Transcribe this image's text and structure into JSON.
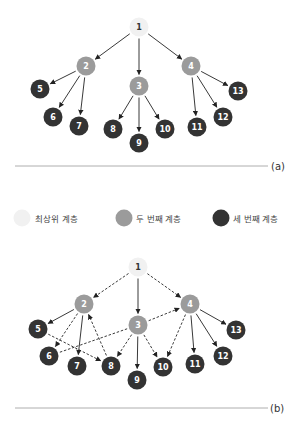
{
  "colors": {
    "top": "#f1f1f1",
    "second": "#9b9b9b",
    "third": "#333333",
    "edge": "#222222",
    "rule": "#999999"
  },
  "legend": [
    {
      "level": "top",
      "label": "최상위 계층"
    },
    {
      "level": "second",
      "label": "두 번째 계층"
    },
    {
      "level": "third",
      "label": "세 번째 계층"
    }
  ],
  "diagrams": [
    {
      "caption": "(a)",
      "nodes": [
        {
          "id": "1",
          "level": "top",
          "x": 139,
          "y": 27
        },
        {
          "id": "2",
          "level": "second",
          "x": 86,
          "y": 66
        },
        {
          "id": "3",
          "level": "second",
          "x": 139,
          "y": 86
        },
        {
          "id": "4",
          "level": "second",
          "x": 191,
          "y": 66
        },
        {
          "id": "5",
          "level": "third",
          "x": 40,
          "y": 89
        },
        {
          "id": "6",
          "level": "third",
          "x": 53,
          "y": 117
        },
        {
          "id": "7",
          "level": "third",
          "x": 79,
          "y": 126
        },
        {
          "id": "8",
          "level": "third",
          "x": 113,
          "y": 129
        },
        {
          "id": "9",
          "level": "third",
          "x": 139,
          "y": 143
        },
        {
          "id": "10",
          "level": "third",
          "x": 165,
          "y": 129
        },
        {
          "id": "11",
          "level": "third",
          "x": 197,
          "y": 127
        },
        {
          "id": "12",
          "level": "third",
          "x": 223,
          "y": 117
        },
        {
          "id": "13",
          "level": "third",
          "x": 238,
          "y": 91
        }
      ],
      "edges": [
        {
          "from": "1",
          "to": "2",
          "style": "solid"
        },
        {
          "from": "1",
          "to": "3",
          "style": "solid"
        },
        {
          "from": "1",
          "to": "4",
          "style": "solid"
        },
        {
          "from": "2",
          "to": "5",
          "style": "solid"
        },
        {
          "from": "2",
          "to": "6",
          "style": "solid"
        },
        {
          "from": "2",
          "to": "7",
          "style": "solid"
        },
        {
          "from": "3",
          "to": "8",
          "style": "solid"
        },
        {
          "from": "3",
          "to": "9",
          "style": "solid"
        },
        {
          "from": "3",
          "to": "10",
          "style": "solid"
        },
        {
          "from": "4",
          "to": "11",
          "style": "solid"
        },
        {
          "from": "4",
          "to": "12",
          "style": "solid"
        },
        {
          "from": "4",
          "to": "13",
          "style": "solid"
        }
      ],
      "rule": {
        "x1": 15,
        "x2": 268,
        "y": 166
      },
      "caption_pos": {
        "x": 271,
        "y": 170
      }
    },
    {
      "caption": "(b)",
      "nodes": [
        {
          "id": "1",
          "level": "top",
          "x": 138,
          "y": 267
        },
        {
          "id": "2",
          "level": "second",
          "x": 84,
          "y": 304
        },
        {
          "id": "3",
          "level": "second",
          "x": 138,
          "y": 325
        },
        {
          "id": "4",
          "level": "second",
          "x": 190,
          "y": 304
        },
        {
          "id": "5",
          "level": "third",
          "x": 38,
          "y": 329
        },
        {
          "id": "6",
          "level": "third",
          "x": 49,
          "y": 356
        },
        {
          "id": "7",
          "level": "third",
          "x": 77,
          "y": 366
        },
        {
          "id": "8",
          "level": "third",
          "x": 111,
          "y": 366
        },
        {
          "id": "9",
          "level": "third",
          "x": 137,
          "y": 380
        },
        {
          "id": "10",
          "level": "third",
          "x": 163,
          "y": 367
        },
        {
          "id": "11",
          "level": "third",
          "x": 195,
          "y": 364
        },
        {
          "id": "12",
          "level": "third",
          "x": 223,
          "y": 356
        },
        {
          "id": "13",
          "level": "third",
          "x": 236,
          "y": 330
        }
      ],
      "edges": [
        {
          "from": "1",
          "to": "2",
          "style": "dashed"
        },
        {
          "from": "1",
          "to": "3",
          "style": "solid"
        },
        {
          "from": "1",
          "to": "4",
          "style": "dashed"
        },
        {
          "from": "2",
          "to": "5",
          "style": "solid"
        },
        {
          "from": "2",
          "to": "6",
          "style": "dashed"
        },
        {
          "from": "2",
          "to": "7",
          "style": "solid"
        },
        {
          "from": "5",
          "to": "8",
          "style": "dashed"
        },
        {
          "from": "8",
          "to": "2",
          "style": "dashed"
        },
        {
          "from": "6",
          "to": "3",
          "style": "dashed",
          "arrow": false
        },
        {
          "from": "3",
          "to": "4",
          "style": "dashed"
        },
        {
          "from": "3",
          "to": "8",
          "style": "dashed"
        },
        {
          "from": "3",
          "to": "9",
          "style": "solid"
        },
        {
          "from": "3",
          "to": "10",
          "style": "dashed"
        },
        {
          "from": "4",
          "to": "10",
          "style": "dashed"
        },
        {
          "from": "4",
          "to": "11",
          "style": "solid"
        },
        {
          "from": "4",
          "to": "12",
          "style": "solid"
        },
        {
          "from": "4",
          "to": "13",
          "style": "solid"
        }
      ],
      "rule": {
        "x1": 15,
        "x2": 268,
        "y": 408
      },
      "caption_pos": {
        "x": 270,
        "y": 412
      }
    }
  ]
}
